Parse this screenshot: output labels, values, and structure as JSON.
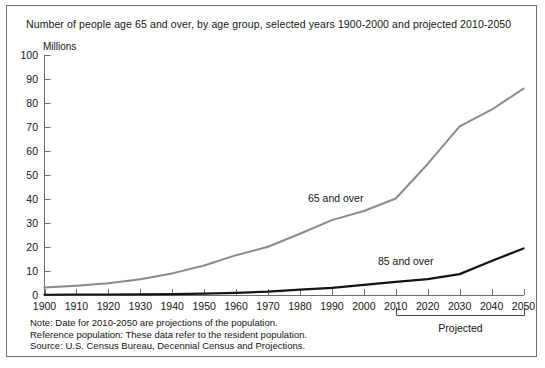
{
  "chart_data": {
    "type": "line",
    "title": "Number of people age 65 and over, by age group, selected years 1900-2000 and projected 2010-2050",
    "ylabel": "Millions",
    "xlabel": "",
    "ylim": [
      0,
      100
    ],
    "xlim": [
      1900,
      2050
    ],
    "grid": false,
    "legend_position": "inline-annotation",
    "y_ticks": [
      "100",
      "90",
      "80",
      "70",
      "60",
      "50",
      "40",
      "30",
      "20",
      "10",
      "0"
    ],
    "y_tick_values": [
      100,
      90,
      80,
      70,
      60,
      50,
      40,
      30,
      20,
      10,
      0
    ],
    "categories": [
      "1900",
      "1910",
      "1920",
      "1930",
      "1940",
      "1950",
      "1960",
      "1970",
      "1980",
      "1990",
      "2000",
      "2010",
      "2020",
      "2030",
      "2040",
      "2050"
    ],
    "x": [
      1900,
      1910,
      1920,
      1930,
      1940,
      1950,
      1960,
      1970,
      1980,
      1990,
      2000,
      2010,
      2020,
      2030,
      2040,
      2050
    ],
    "series": [
      {
        "name": "65 and over",
        "color": "#8a8a8a",
        "values": [
          3.1,
          3.9,
          4.9,
          6.6,
          9.0,
          12.3,
          16.6,
          20.1,
          25.5,
          31.2,
          35.0,
          40.2,
          54.6,
          70.3,
          77.2,
          86.0
        ]
      },
      {
        "name": "85 and over",
        "color": "#141414",
        "values": [
          0.1,
          0.2,
          0.2,
          0.3,
          0.4,
          0.6,
          0.9,
          1.4,
          2.2,
          3.0,
          4.2,
          5.5,
          6.6,
          8.7,
          14.2,
          19.4
        ]
      }
    ],
    "annotations": [
      {
        "name": "series-label-65",
        "text": "65 and over",
        "x": 2000,
        "y": 36
      },
      {
        "name": "series-label-85",
        "text": "85 and over",
        "x": 2023,
        "y": 14
      },
      {
        "name": "projected-bracket",
        "text": "Projected",
        "x_start": 2010,
        "x_end": 2050
      }
    ],
    "projected_label": "Projected",
    "projected_range": [
      2010,
      2050
    ]
  },
  "notes": [
    "Note: Date for 2010-2050 are projections of the population.",
    "Reference population: These data refer to the resident population.",
    "Source: U.S. Census Bureau, Decennial Census and Projections."
  ]
}
